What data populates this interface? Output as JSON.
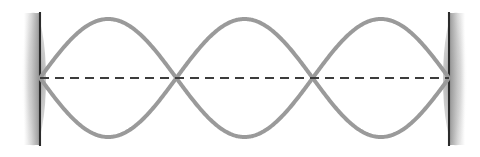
{
  "figure": {
    "background_color": "#ffffff",
    "width": 480,
    "height": 157
  },
  "chart_data": {
    "type": "line",
    "subtitle": "Third harmonic (second overtone) — three antinodes, four nodes",
    "xlabel": "",
    "ylabel": "",
    "xlim": [
      40,
      449
    ],
    "ylim": [
      19,
      137
    ],
    "grid": false,
    "legend_position": "none",
    "harmonic_number": 3,
    "antinode_count": 3,
    "node_count": 4,
    "equilibrium_y": 78,
    "amplitude_px": 59,
    "node_positions_x": [
      40,
      176.33,
      312.67,
      449
    ],
    "antinode_positions_x": [
      108.17,
      244.5,
      380.83
    ],
    "series": [
      {
        "name": "upper-envelope",
        "color": "#9a9a9a",
        "stroke_width": 4,
        "x": [
          40,
          57,
          74,
          91,
          108,
          125,
          142,
          159,
          176,
          193,
          210,
          227,
          245,
          262,
          279,
          296,
          313,
          330,
          347,
          364,
          381,
          398,
          415,
          432,
          449
        ],
        "y": [
          78,
          40.8,
          23.5,
          19.4,
          19.0,
          23.0,
          40.0,
          62.9,
          78.0,
          57.7,
          30.5,
          20.0,
          19.1,
          21.8,
          34.5,
          56.8,
          78.0,
          60.6,
          32.2,
          20.4,
          19.0,
          22.5,
          37.7,
          60.8,
          78
        ]
      },
      {
        "name": "lower-envelope",
        "color": "#9a9a9a",
        "stroke_width": 4,
        "x": [
          40,
          57,
          74,
          91,
          108,
          125,
          142,
          159,
          176,
          193,
          210,
          227,
          245,
          262,
          279,
          296,
          313,
          330,
          347,
          364,
          381,
          398,
          415,
          432,
          449
        ],
        "y": [
          78,
          115.2,
          132.5,
          136.6,
          137.0,
          133.0,
          116.0,
          93.1,
          78.0,
          98.3,
          125.5,
          136.0,
          136.9,
          134.2,
          121.5,
          99.2,
          78.0,
          95.4,
          123.8,
          135.6,
          137.0,
          133.5,
          118.3,
          95.2,
          78
        ]
      }
    ],
    "reference_line": {
      "name": "equilibrium-axis",
      "style": "dashed",
      "color": "#3c3c3c",
      "y": 78,
      "x_start": 40,
      "x_end": 449,
      "dash_length": 9,
      "gap_length": 6,
      "stroke_width": 2.2
    },
    "boundaries": [
      {
        "name": "left-wall",
        "x": 40,
        "y_top": 12,
        "y_bottom": 146,
        "color": "#2b2b2b",
        "shadow_side": "left",
        "shadow_color": "#b4b4b4"
      },
      {
        "name": "right-wall",
        "x": 449,
        "y_top": 12,
        "y_bottom": 146,
        "color": "#2b2b2b",
        "shadow_side": "right",
        "shadow_color": "#b4b4b4"
      }
    ],
    "colors": {
      "wave": "#9a9a9a",
      "axis": "#3c3c3c",
      "wall": "#2b2b2b",
      "wall_shadow": "#b4b4b4",
      "background": "#ffffff"
    }
  }
}
